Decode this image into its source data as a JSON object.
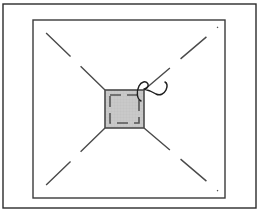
{
  "canvas": {
    "width": 259,
    "height": 215,
    "background_color": "#ffffff",
    "title": "Technical line drawing: framed plan view with central shaded square"
  },
  "colors": {
    "outline": "#2b2b2b",
    "frame_line": "#3a3a3a",
    "diagonal_line": "#4a4a4a",
    "square_fill": "#c9c9c9",
    "square_stroke": "#4a4a4a",
    "square_inner_dash": "#555555",
    "curve_stroke": "#1e1e1e",
    "background": "#ffffff"
  },
  "outer_border": {
    "label": "outer page border",
    "x": 3,
    "y": 4,
    "width": 253,
    "height": 204,
    "stroke_width": 1.4
  },
  "inner_frame": {
    "label": "inner rectangular frame",
    "x": 33,
    "y": 20,
    "width": 192,
    "height": 178,
    "stroke_width": 1.4
  },
  "center_square": {
    "label": "central shaded square",
    "x": 105,
    "y": 90,
    "width": 39,
    "height": 38,
    "stroke_width": 1.6,
    "fill": "#c9c9c9",
    "inner_dash": {
      "inset": 5,
      "dash_pattern": "11 6",
      "stroke_width": 1.6
    },
    "hatch": {
      "spacing": 3,
      "color": "#b3b3b3"
    }
  },
  "diagonals": {
    "label": "dashed diagonal sight lines from square corners to frame corners",
    "dash_pattern": "34 14",
    "stroke_width": 1.4,
    "lines": [
      {
        "name": "diagonal-top-left",
        "x1": 105,
        "y1": 90,
        "x2": 40,
        "y2": 27
      },
      {
        "name": "diagonal-top-right",
        "x1": 144,
        "y1": 90,
        "x2": 218,
        "y2": 27
      },
      {
        "name": "diagonal-bottom-left",
        "x1": 105,
        "y1": 128,
        "x2": 40,
        "y2": 191
      },
      {
        "name": "diagonal-bottom-right",
        "x1": 144,
        "y1": 128,
        "x2": 218,
        "y2": 191
      }
    ]
  },
  "callout_curve": {
    "label": "hand-drawn hook / leader curve at top-right of square",
    "stroke_width": 1.5,
    "path": "M 141 101 C 137 99 136 92 139 86 C 141 82 146 80 148 84 C 149 87 146 89 144 89 C 148 90 153 92 156 94 C 160 96 164 94 166 90 C 168 86 167 83 165 82"
  },
  "legend": {
    "visible": false,
    "items": []
  }
}
